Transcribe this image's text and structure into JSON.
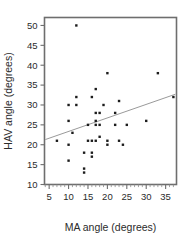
{
  "chart_data": {
    "type": "scatter",
    "title": "",
    "subtitle": "",
    "xlabel": "MA angle (degrees)",
    "ylabel": "HAV angle (degrees)",
    "xlim": [
      3.8,
      37.8
    ],
    "ylim": [
      10.0,
      52.0
    ],
    "xticks": [
      5,
      10,
      15,
      20,
      25,
      30,
      35
    ],
    "xtick_labels": [
      "5",
      "10",
      "15",
      "20",
      "25",
      "30",
      "35"
    ],
    "yticks": [
      10,
      15,
      20,
      25,
      30,
      35,
      40,
      45,
      50
    ],
    "ytick_labels": [
      "10",
      "15",
      "20",
      "25",
      "30",
      "35",
      "40",
      "45",
      "50"
    ],
    "x_minor_tick_step": 1,
    "grid": false,
    "legend": null,
    "legend_position": "none",
    "marker": "square",
    "marker_color": "#1c1c1c",
    "frame_color": "#6e6e6e",
    "series": [
      {
        "name": "observations",
        "type": "scatter",
        "x": [
          7,
          10,
          10,
          10,
          10,
          11,
          12,
          12,
          12,
          14,
          14,
          14,
          15,
          15,
          16,
          16,
          16,
          16,
          17,
          17,
          17,
          17,
          17,
          18,
          18,
          18,
          19,
          20,
          20,
          20,
          22,
          22,
          23,
          23,
          24,
          25,
          30,
          33,
          37
        ],
        "y": [
          21,
          30,
          26,
          20,
          16,
          23,
          50,
          32,
          30,
          13,
          18,
          14,
          21,
          25,
          32,
          18,
          17,
          21,
          28,
          25,
          34,
          26,
          21,
          28,
          25,
          22,
          30,
          38,
          20,
          21,
          25,
          28,
          21,
          31,
          20,
          25,
          26,
          38,
          32
        ],
        "points": [
          [
            7,
            21
          ],
          [
            10,
            30
          ],
          [
            10,
            26
          ],
          [
            10,
            20
          ],
          [
            10,
            16
          ],
          [
            11,
            23
          ],
          [
            12,
            50
          ],
          [
            12,
            32
          ],
          [
            12,
            30
          ],
          [
            14,
            13
          ],
          [
            14,
            18
          ],
          [
            14,
            14
          ],
          [
            15,
            21
          ],
          [
            15,
            25
          ],
          [
            16,
            32
          ],
          [
            16,
            18
          ],
          [
            16,
            17
          ],
          [
            16,
            21
          ],
          [
            17,
            28
          ],
          [
            17,
            25
          ],
          [
            17,
            34
          ],
          [
            17,
            26
          ],
          [
            17,
            21
          ],
          [
            18,
            28
          ],
          [
            18,
            25
          ],
          [
            18,
            22
          ],
          [
            19,
            30
          ],
          [
            20,
            38
          ],
          [
            20,
            20
          ],
          [
            20,
            21
          ],
          [
            22,
            25
          ],
          [
            22,
            28
          ],
          [
            23,
            21
          ],
          [
            23,
            31
          ],
          [
            24,
            20
          ],
          [
            25,
            25
          ],
          [
            30,
            26
          ],
          [
            33,
            38
          ],
          [
            37,
            32
          ]
        ],
        "n": 39
      },
      {
        "name": "regression-line",
        "type": "line",
        "x": [
          4.0,
          37.5
        ],
        "y": [
          21.3,
          32.7
        ],
        "color": "#9a9a9a"
      }
    ]
  },
  "axes": {
    "x_title": "MA angle (degrees)",
    "y_title": "HAV angle (degrees)"
  }
}
